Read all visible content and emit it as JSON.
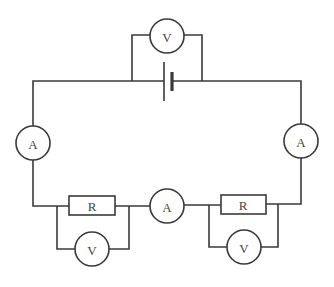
{
  "diagram": {
    "type": "circuit-schematic",
    "colors": {
      "line": "#3a3a3a",
      "text": "#444444",
      "background": "#ffffff"
    },
    "components": {
      "battery": {
        "label": ""
      },
      "voltmeter_battery": {
        "label": "V"
      },
      "ammeter_left": {
        "label": "A"
      },
      "ammeter_right": {
        "label": "A"
      },
      "ammeter_middle": {
        "label": "A"
      },
      "resistor_left": {
        "label": "R"
      },
      "resistor_right": {
        "label": "R"
      },
      "voltmeter_left": {
        "label": "V"
      },
      "voltmeter_right": {
        "label": "V"
      }
    }
  }
}
